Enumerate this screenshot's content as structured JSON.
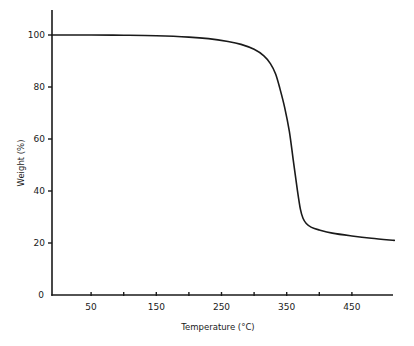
{
  "chart_data": {
    "type": "line",
    "title": "",
    "xlabel": "Temperature (°C)",
    "ylabel": "Weight (%)",
    "xlim": [
      -10,
      515
    ],
    "ylim": [
      0,
      110
    ],
    "grid": false,
    "legend": null,
    "x_ticks": [
      {
        "value": 50,
        "label": "50"
      },
      {
        "value": 100,
        "label": ""
      },
      {
        "value": 150,
        "label": "150"
      },
      {
        "value": 200,
        "label": ""
      },
      {
        "value": 250,
        "label": "250"
      },
      {
        "value": 300,
        "label": ""
      },
      {
        "value": 350,
        "label": "350"
      },
      {
        "value": 400,
        "label": ""
      },
      {
        "value": 450,
        "label": "450"
      }
    ],
    "y_ticks": [
      {
        "value": 0,
        "label": "0"
      },
      {
        "value": 20,
        "label": "20"
      },
      {
        "value": 40,
        "label": "40"
      },
      {
        "value": 60,
        "label": "60"
      },
      {
        "value": 80,
        "label": "80"
      },
      {
        "value": 100,
        "label": "100"
      }
    ],
    "series": [
      {
        "name": "TGA weight loss",
        "color": "#1a1a1a",
        "x": [
          -10,
          50,
          100,
          150,
          200,
          230,
          260,
          280,
          300,
          315,
          325,
          333,
          340,
          347,
          354,
          360,
          366,
          371,
          375,
          380,
          388,
          400,
          420,
          450,
          480,
          515
        ],
        "y": [
          100,
          100,
          99.9,
          99.7,
          99.2,
          98.6,
          97.5,
          96.4,
          94.5,
          92,
          89,
          85,
          79,
          72,
          63,
          52,
          41,
          33,
          29.5,
          27.5,
          26,
          25,
          23.8,
          22.7,
          21.8,
          21
        ]
      }
    ]
  }
}
